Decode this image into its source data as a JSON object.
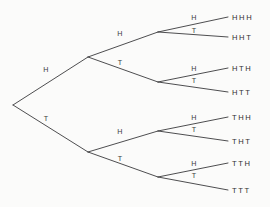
{
  "diagram": {
    "background_color": "#fbfbfa",
    "line_color": "#3a3a3c",
    "text_color": "#2f2f31",
    "root": {
      "x": 13,
      "y": 105
    },
    "levels": 3,
    "branch_labels": {
      "heads": "H",
      "tails": "T"
    },
    "nodes": [
      {
        "id": "root",
        "x": 13,
        "y": 105
      },
      {
        "id": "H",
        "x": 88,
        "y": 57
      },
      {
        "id": "T",
        "x": 88,
        "y": 152
      },
      {
        "id": "HH",
        "x": 158,
        "y": 32
      },
      {
        "id": "HT",
        "x": 158,
        "y": 82
      },
      {
        "id": "TH",
        "x": 158,
        "y": 131
      },
      {
        "id": "TT",
        "x": 158,
        "y": 177
      },
      {
        "id": "HHH",
        "x": 228,
        "y": 17
      },
      {
        "id": "HHT",
        "x": 228,
        "y": 37
      },
      {
        "id": "HTH",
        "x": 228,
        "y": 68
      },
      {
        "id": "HTT",
        "x": 228,
        "y": 92
      },
      {
        "id": "THH",
        "x": 228,
        "y": 117
      },
      {
        "id": "THT",
        "x": 228,
        "y": 141
      },
      {
        "id": "TTH",
        "x": 228,
        "y": 163
      },
      {
        "id": "TTT",
        "x": 228,
        "y": 190
      }
    ],
    "edges": [
      {
        "id": "e-root-H",
        "from": "root",
        "to": "H",
        "label": "H",
        "label_x": 46,
        "label_y": 72
      },
      {
        "id": "e-root-T",
        "from": "root",
        "to": "T",
        "label": "T",
        "label_x": 46,
        "label_y": 121
      },
      {
        "id": "e-H-HH",
        "from": "H",
        "to": "HH",
        "label": "H",
        "label_x": 120,
        "label_y": 36
      },
      {
        "id": "e-H-HT",
        "from": "H",
        "to": "HT",
        "label": "T",
        "label_x": 120,
        "label_y": 65
      },
      {
        "id": "e-T-TH",
        "from": "T",
        "to": "TH",
        "label": "H",
        "label_x": 120,
        "label_y": 134
      },
      {
        "id": "e-T-TT",
        "from": "T",
        "to": "TT",
        "label": "T",
        "label_x": 120,
        "label_y": 161
      },
      {
        "id": "e-HH-HHH",
        "from": "HH",
        "to": "HHH",
        "label": "H",
        "label_x": 194,
        "label_y": 20
      },
      {
        "id": "e-HH-HHT",
        "from": "HH",
        "to": "HHT",
        "label": "T",
        "label_x": 194,
        "label_y": 33
      },
      {
        "id": "e-HT-HTH",
        "from": "HT",
        "to": "HTH",
        "label": "H",
        "label_x": 194,
        "label_y": 71
      },
      {
        "id": "e-HT-HTT",
        "from": "HT",
        "to": "HTT",
        "label": "T",
        "label_x": 194,
        "label_y": 83
      },
      {
        "id": "e-TH-THH",
        "from": "TH",
        "to": "THH",
        "label": "H",
        "label_x": 194,
        "label_y": 120
      },
      {
        "id": "e-TH-THT",
        "from": "TH",
        "to": "THT",
        "label": "T",
        "label_x": 194,
        "label_y": 132
      },
      {
        "id": "e-TT-TTH",
        "from": "TT",
        "to": "TTH",
        "label": "H",
        "label_x": 194,
        "label_y": 166
      },
      {
        "id": "e-TT-TTT",
        "from": "TT",
        "to": "TTT",
        "label": "T",
        "label_x": 194,
        "label_y": 178
      }
    ],
    "outcomes": [
      {
        "id": "outcome-hhh",
        "text": "HHH",
        "x": 232,
        "y": 20
      },
      {
        "id": "outcome-hht",
        "text": "HHT",
        "x": 232,
        "y": 40
      },
      {
        "id": "outcome-hth",
        "text": "HTH",
        "x": 232,
        "y": 71
      },
      {
        "id": "outcome-htt",
        "text": "HTT",
        "x": 232,
        "y": 95
      },
      {
        "id": "outcome-thh",
        "text": "THH",
        "x": 232,
        "y": 120
      },
      {
        "id": "outcome-tht",
        "text": "THT",
        "x": 232,
        "y": 144
      },
      {
        "id": "outcome-tth",
        "text": "TTH",
        "x": 232,
        "y": 166
      },
      {
        "id": "outcome-ttt",
        "text": "TTT",
        "x": 232,
        "y": 193
      }
    ]
  },
  "chart_data": {
    "type": "diagram",
    "subtype": "probability-tree",
    "depth": 3,
    "branch_options": [
      "H",
      "T"
    ],
    "outcomes": [
      "HHH",
      "HHT",
      "HTH",
      "HTT",
      "THH",
      "THT",
      "TTH",
      "TTT"
    ],
    "outcome_count": 8,
    "xlabel": "",
    "ylabel": "",
    "legend": [],
    "grid": false
  }
}
